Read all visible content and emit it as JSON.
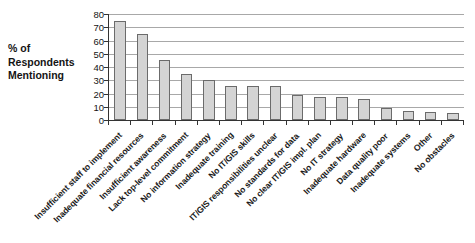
{
  "chart_data": {
    "type": "bar",
    "title": "",
    "xlabel": "",
    "ylabel": "% of Respondents Mentioning",
    "ylim": [
      0,
      80
    ],
    "yticks": [
      0,
      10,
      20,
      30,
      40,
      50,
      60,
      70,
      80
    ],
    "grid": true,
    "legend": false,
    "orientation": "vertical",
    "xtick_rotation": -45,
    "bar_color": "#d4d4d4",
    "bar_edge_color": "#6b6b6b",
    "gridline_color": "#a8a8a8",
    "axis_color": "#333333",
    "categories": [
      "Insufficient staff to implement",
      "Inadequate financial resources",
      "Insufficient awareness",
      "Lack top-level commitment",
      "No information strategy",
      "Inadequate training",
      "No IT/GIS skills",
      "IT/GIS responsibilities unclear",
      "No standards for data",
      "No clear IT/GIS impl. plan",
      "No IT strategy",
      "Inadequate hardware",
      "Data quality poor",
      "Inadequate systems",
      "Other",
      "No obstacles"
    ],
    "values": [
      75,
      65,
      45,
      35,
      30,
      26,
      26,
      26,
      19,
      17.5,
      17.5,
      16,
      9,
      7,
      6,
      5
    ]
  },
  "axis": {
    "y_title_lines": [
      "% of",
      "Respondents",
      "Mentioning"
    ]
  }
}
